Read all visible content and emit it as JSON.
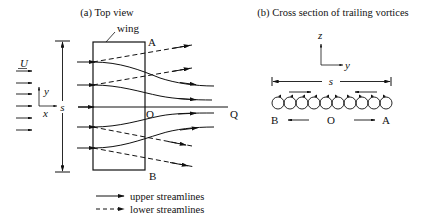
{
  "panel_a": {
    "title": "(a) Top view",
    "wing_label": "wing",
    "point_A": "A",
    "point_B": "B",
    "point_O": "O",
    "point_Q": "Q",
    "freestream_label": "U",
    "span_label": "s",
    "axis_x": "x",
    "axis_y": "y",
    "legend": {
      "upper": "upper streamlines",
      "lower": "lower streamlines"
    }
  },
  "panel_b": {
    "title": "(b) Cross section of trailing vortices",
    "axis_z": "z",
    "axis_y": "y",
    "span_label": "s",
    "point_B": "B",
    "point_O": "O",
    "point_A": "A",
    "vortex_count": 10
  },
  "colors": {
    "ink": "#111111",
    "background": "#ffffff"
  }
}
